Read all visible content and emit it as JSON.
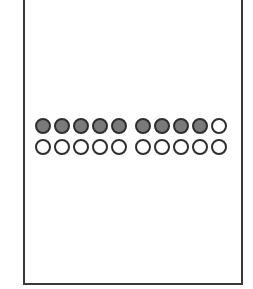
{
  "diagram": {
    "type": "twenty-frame",
    "rows": [
      {
        "groups": [
          [
            true,
            true,
            true,
            true,
            true
          ],
          [
            true,
            true,
            true,
            true,
            false
          ]
        ]
      },
      {
        "groups": [
          [
            false,
            false,
            false,
            false,
            false
          ],
          [
            false,
            false,
            false,
            false,
            false
          ]
        ]
      }
    ],
    "filled_count": 9,
    "total_count": 20,
    "colors": {
      "filled": "#7a7a7a",
      "empty": "#ffffff",
      "stroke": "#2e2e2e",
      "border": "#3a3a3a"
    }
  }
}
